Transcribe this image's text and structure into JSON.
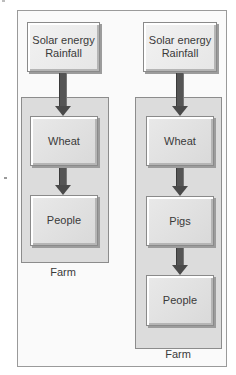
{
  "diagram": {
    "left_column": {
      "source": {
        "line1": "Solar energy",
        "line2": "Rainfall"
      },
      "chain": [
        "Wheat",
        "People"
      ],
      "container_label": "Farm"
    },
    "right_column": {
      "source": {
        "line1": "Solar energy",
        "line2": "Rainfall"
      },
      "chain": [
        "Wheat",
        "Pigs",
        "People"
      ],
      "container_label": "Farm"
    },
    "colors": {
      "arrow": "#555555",
      "farm_fill": "#dcdcdc",
      "box_fill": "#ebebeb",
      "frame_border": "#9a9a9a"
    }
  }
}
